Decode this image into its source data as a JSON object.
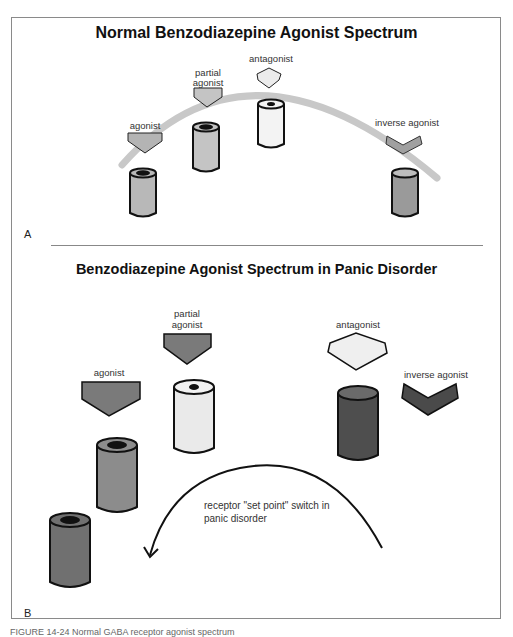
{
  "figure": {
    "caption_partial": "FIGURE 14-24 Normal GABA receptor agonist spectrum",
    "colors": {
      "arc": "#c8c8c8",
      "agonist_fill_A": "#b4b4b4",
      "partial_fill_A": "#c4c4c4",
      "antagonist_fill": "#ececec",
      "inverse_fill_A": "#a0a0a0",
      "agonist_fill_B": "#7a7a7a",
      "antagonist_fill_B": "#efefef",
      "inverse_fill_B": "#4a4a4a",
      "cyl_dark": "#505050",
      "cyl_mid": "#8c8c8c",
      "cyl_light": "#eaeaea",
      "outline": "#111111"
    }
  },
  "panelA": {
    "title": "Normal Benzodiazepine Agonist Spectrum",
    "letter": "A",
    "labels": {
      "agonist": "agonist",
      "partial_agonist_line1": "partial",
      "partial_agonist_line2": "agonist",
      "antagonist": "antagonist",
      "inverse_agonist": "inverse agonist"
    }
  },
  "panelB": {
    "title": "Benzodiazepine Agonist Spectrum in Panic Disorder",
    "letter": "B",
    "labels": {
      "agonist": "agonist",
      "partial_agonist_line1": "partial",
      "partial_agonist_line2": "agonist",
      "antagonist": "antagonist",
      "inverse_agonist": "inverse agonist"
    },
    "arrow_label_line1": "receptor \"set point\" switch in",
    "arrow_label_line2": "panic disorder"
  }
}
